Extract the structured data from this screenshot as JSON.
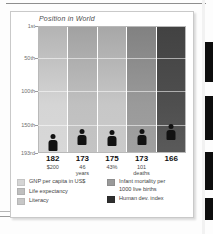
{
  "figure": {
    "title": "Position in World"
  },
  "chart_data": {
    "type": "bar",
    "title": "Position in World",
    "xlabel": "",
    "ylabel": "Position in World",
    "ylim": [
      1,
      193
    ],
    "y_axis_inverted": true,
    "grid": true,
    "legend_position": "bottom",
    "tick_labels": [
      "1st",
      "50th",
      "100th",
      "150th",
      "193rd"
    ],
    "tick_values": [
      1,
      50,
      100,
      150,
      193
    ],
    "categories": [
      "GNP per capita in US$",
      "Life expectancy",
      "Literacy",
      "Infant mortality per 1000 live births",
      "Human dev. index"
    ],
    "values": [
      182,
      173,
      175,
      173,
      166
    ],
    "value_labels": [
      "182",
      "173",
      "175",
      "173",
      "166"
    ],
    "sub_labels": [
      "$200",
      "46\nyears",
      "43%",
      "101\ndeaths",
      ""
    ],
    "series": [
      {
        "name": "World ranking",
        "values": [
          182,
          173,
          175,
          173,
          166
        ]
      }
    ],
    "bar_colors": [
      "#d5d5d5",
      "#c0c0c0",
      "#c7c7c7",
      "#9a9a9a",
      "#4f4f4f"
    ],
    "marker": "person-icon"
  },
  "axis": {
    "ticks": [
      {
        "label": "1st",
        "value": 1
      },
      {
        "label": "50th",
        "value": 50
      },
      {
        "label": "100th",
        "value": 100
      },
      {
        "label": "150th",
        "value": 150
      },
      {
        "label": "193rd",
        "value": 193
      }
    ]
  },
  "bars": [
    {
      "rank": "182",
      "sub": "$200",
      "color": "#d5d5d5"
    },
    {
      "rank": "173",
      "sub": "46\nyears",
      "color": "#c0c0c0"
    },
    {
      "rank": "175",
      "sub": "43%",
      "color": "#c7c7c7"
    },
    {
      "rank": "173",
      "sub": "101\ndeaths",
      "color": "#9a9a9a"
    },
    {
      "rank": "166",
      "sub": "",
      "color": "#4f4f4f"
    }
  ],
  "legend": {
    "left": [
      {
        "label": "GNP per capita in US$",
        "color": "#d5d5d5"
      },
      {
        "label": "Life expectancy",
        "color": "#bfbfbf"
      },
      {
        "label": "Literacy",
        "color": "#c7c7c7"
      }
    ],
    "right": [
      {
        "label": "Infant mortality per\n1000 live births",
        "color": "#9a9a9a"
      },
      {
        "label": "Human dev. index",
        "color": "#2f2f2f"
      }
    ]
  }
}
